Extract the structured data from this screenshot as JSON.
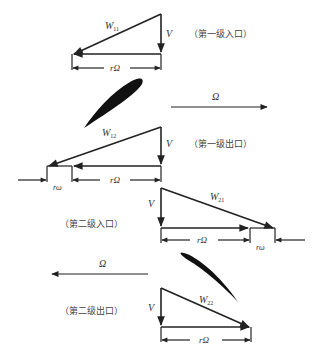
{
  "diagram": {
    "title": "",
    "colors": {
      "line": "#222222",
      "text": "#333333",
      "blade": "#111111",
      "background": "#ffffff"
    },
    "stages": [
      {
        "caption": "（第一级入口）",
        "relative_velocity": "W",
        "relative_velocity_sub": "11",
        "axial_velocity": "V",
        "rotor_speed_label": "rΩ"
      },
      {
        "caption": "（第一级出口）",
        "relative_velocity": "W",
        "relative_velocity_sub": "12",
        "axial_velocity": "V",
        "rotor_speed_label": "rΩ",
        "blade_speed_label": "rω"
      },
      {
        "caption": "（第二级入口）",
        "relative_velocity": "W",
        "relative_velocity_sub": "21",
        "axial_velocity": "V",
        "rotor_speed_label": "rΩ",
        "blade_speed_label": "rω"
      },
      {
        "caption": "（第二级出口）",
        "relative_velocity": "W",
        "relative_velocity_sub": "22",
        "axial_velocity": "V",
        "rotor_speed_label": "rΩ"
      }
    ],
    "rotation": [
      {
        "label": "Ω",
        "direction": "right"
      },
      {
        "label": "Ω",
        "direction": "left"
      }
    ],
    "blades": [
      {
        "name": "first-stage-blade"
      },
      {
        "name": "second-stage-blade"
      }
    ]
  }
}
